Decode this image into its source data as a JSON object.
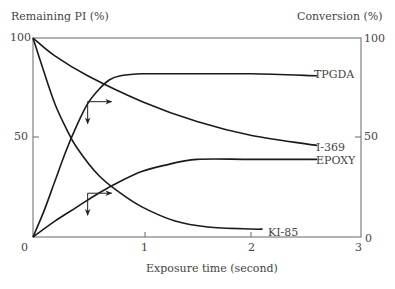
{
  "chart_data": {
    "type": "line",
    "title": "",
    "xlabel": "Exposure time (second)",
    "ylabel_left": "Remaining PI (%)",
    "ylabel_right": "Conversion (%)",
    "xlim": [
      0,
      3
    ],
    "ylim_left": [
      0,
      100
    ],
    "ylim_right": [
      0,
      100
    ],
    "x_ticks": [
      "0",
      "1",
      "2",
      "3"
    ],
    "y_ticks_left": [
      "100",
      "50",
      "0"
    ],
    "y_ticks_right": [
      "100",
      "50",
      "0"
    ],
    "grid": false,
    "legend": "inline labels at line ends",
    "series": [
      {
        "name": "TPGDA",
        "axis": "right",
        "kind": "conversion",
        "x": [
          0,
          0.1,
          0.2,
          0.3,
          0.4,
          0.5,
          0.6,
          0.7,
          0.8,
          1.0,
          1.5,
          2.0,
          2.6
        ],
        "values": [
          0,
          13,
          28,
          43,
          56,
          67,
          74,
          79,
          81,
          82,
          82,
          82,
          81
        ]
      },
      {
        "name": "I-369",
        "axis": "left",
        "kind": "remaining PI",
        "x": [
          0,
          0.2,
          0.5,
          1.0,
          1.5,
          2.0,
          2.6
        ],
        "values": [
          100,
          91,
          81,
          68,
          58,
          51,
          46
        ]
      },
      {
        "name": "EPOXY",
        "axis": "right",
        "kind": "conversion",
        "x": [
          0,
          0.2,
          0.4,
          0.6,
          0.8,
          1.0,
          1.2,
          1.5,
          2.0,
          2.6
        ],
        "values": [
          0,
          8,
          15,
          22,
          28,
          33,
          36,
          39,
          39,
          39
        ]
      },
      {
        "name": "KI-85",
        "axis": "left",
        "kind": "remaining PI",
        "x": [
          0,
          0.1,
          0.2,
          0.3,
          0.4,
          0.6,
          0.8,
          1.0,
          1.3,
          1.6,
          2.0,
          2.1
        ],
        "values": [
          100,
          83,
          67,
          55,
          45,
          31,
          22,
          15,
          8,
          5,
          4,
          4
        ]
      }
    ],
    "annotations": [
      {
        "type": "axis-pointer-arrows",
        "near": "TPGDA",
        "at_x": 0.5,
        "at_y": 68,
        "meaning": "down arrow → left axis, right arrow → right axis"
      },
      {
        "type": "axis-pointer-arrows",
        "near": "EPOXY",
        "at_x": 0.5,
        "at_y": 22,
        "meaning": "down arrow → left axis, right arrow → right axis"
      }
    ]
  }
}
